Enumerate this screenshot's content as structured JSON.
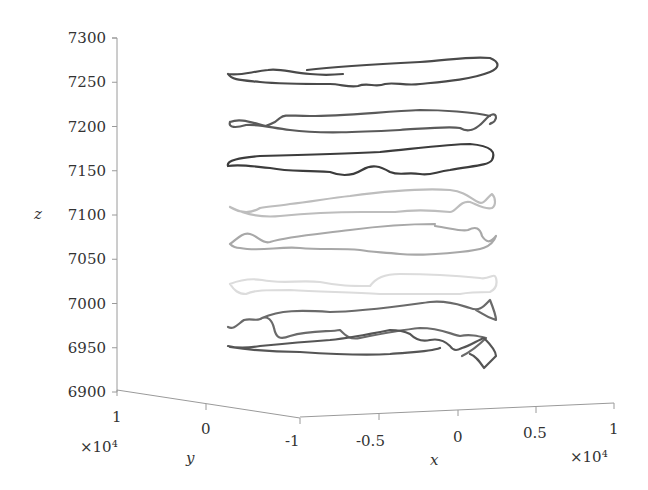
{
  "chart_data": {
    "type": "line",
    "projection": "3d",
    "title": "",
    "xlabel": "x",
    "ylabel": "y",
    "zlabel": "z",
    "x_ticks": [
      "-1",
      "-0.5",
      "0",
      "0.5",
      "1"
    ],
    "x_exponent": "×10⁴",
    "y_ticks": [
      "1",
      "0",
      "-1"
    ],
    "y_exponent": "×10⁴",
    "z_ticks": [
      "7300",
      "7250",
      "7200",
      "7150",
      "7100",
      "7050",
      "7000",
      "6950",
      "6900"
    ],
    "xlim": [
      -10000,
      10000
    ],
    "ylim": [
      -10000,
      10000
    ],
    "zlim": [
      6900,
      7300
    ],
    "grid": false,
    "legend": null,
    "series": [
      {
        "name": "trajectory-z7255",
        "z_level": 7255,
        "color": "#4a4a4a",
        "path": "M228,74 C240,76 250,72 268,70 C280,68 292,73 310,74 C320,75 332,75 343,74 M307,70 C340,66 380,64 420,62 C450,60 470,56 490,58 C500,62 500,68 490,72 C470,80 440,82 420,84 C405,86 395,82 385,84 C375,88 368,82 358,86 C350,88 340,84 330,84 C300,84 280,84 260,82 C240,80 232,80 228,74"
      },
      {
        "name": "trajectory-z7200",
        "z_level": 7200,
        "color": "#5a5a5a",
        "path": "M230,122 C228,128 236,128 246,125 C260,124 272,128 290,130 C320,134 360,132 400,130 C430,128 450,126 460,128 C470,134 478,128 485,120 C490,114 496,112 496,118 C494,124 492,122 490,124 M490,116 C475,112 440,110 420,110 C380,112 340,116 310,116 C290,116 285,114 280,118 C274,124 270,124 266,126 C250,122 240,118 230,122"
      },
      {
        "name": "trajectory-z7160",
        "z_level": 7160,
        "color": "#3c3c3c",
        "path": "M228,166 C226,160 240,158 260,156 C300,155 340,154 380,152 C420,148 450,144 470,144 C492,146 496,152 492,160 C488,166 470,166 450,170 C435,172 430,176 420,174 C405,172 400,176 390,172 C380,166 372,164 362,170 C352,176 340,176 330,172 C300,170 290,172 270,168 C250,166 240,164 228,166"
      },
      {
        "name": "trajectory-z7110",
        "z_level": 7110,
        "color": "#bdbdbd",
        "path": "M230,207 C240,213 250,214 260,208 C270,206 280,206 290,204 C310,202 330,198 350,196 C380,192 420,188 450,190 C466,192 470,198 478,202 C484,206 488,196 492,194 C496,198 496,206 492,208 C484,210 476,204 470,202 C460,200 456,212 450,212 C430,210 410,210 395,212 C380,212 370,212 362,212 C330,212 300,214 280,216 C260,218 244,214 230,207"
      },
      {
        "name": "trajectory-z7060",
        "z_level": 7060,
        "color": "#a8a8a8",
        "path": "M230,244 C236,240 242,232 250,234 C258,236 262,244 270,242 C290,236 320,234 350,230 C380,226 410,224 435,224 M435,226 C450,228 462,232 468,230 C476,226 480,228 482,236 C486,242 490,244 496,236 C492,248 480,250 460,252 C440,254 420,256 400,254 C380,252 370,252 360,250 C340,248 320,250 300,248 C280,246 260,252 240,248 C236,248 232,246 230,244"
      },
      {
        "name": "trajectory-z7015",
        "z_level": 7015,
        "color": "#dcdcdc",
        "path": "M230,284 C240,280 250,278 262,280 C280,284 300,280 320,282 C340,286 350,286 370,286 C376,278 384,274 400,274 C430,274 460,276 480,278 C490,280 494,272 496,278 C498,286 494,290 490,292 C476,292 470,292 460,294 C430,294 400,294 380,294 C350,292 320,292 290,290 C266,290 254,290 246,294 C238,294 234,290 230,284"
      },
      {
        "name": "trajectory-z6960a",
        "z_level": 6975,
        "color": "#6a6a6a",
        "path": "M228,327 C234,330 238,324 244,320 C252,318 258,322 262,318 C268,316 272,320 274,328 C276,338 280,340 290,336 C310,330 330,332 340,330 C346,336 350,340 360,338 C380,334 400,330 420,328 C440,328 450,334 460,336 C470,334 478,336 486,338 C478,346 470,352 462,356 M262,318 C280,310 300,310 330,312 C360,312 400,306 430,302 C450,300 462,306 470,308 C480,312 484,306 490,300 C494,310 496,316 496,320 C484,316 480,312 476,310"
      },
      {
        "name": "trajectory-z6960b",
        "z_level": 6950,
        "color": "#555555",
        "path": "M228,346 C236,348 248,348 260,346 C280,344 300,342 330,340 C350,338 370,334 390,330 C400,330 406,332 410,334 C416,340 422,342 430,340 C440,338 446,342 450,346 C454,352 458,350 462,348 C470,346 478,340 484,338 C490,344 496,352 496,356 C494,358 490,362 484,368 C480,362 476,356 470,354 M230,347 C250,350 270,352 300,352 C330,354 360,356 390,354 C410,352 430,352 440,348"
      }
    ]
  }
}
